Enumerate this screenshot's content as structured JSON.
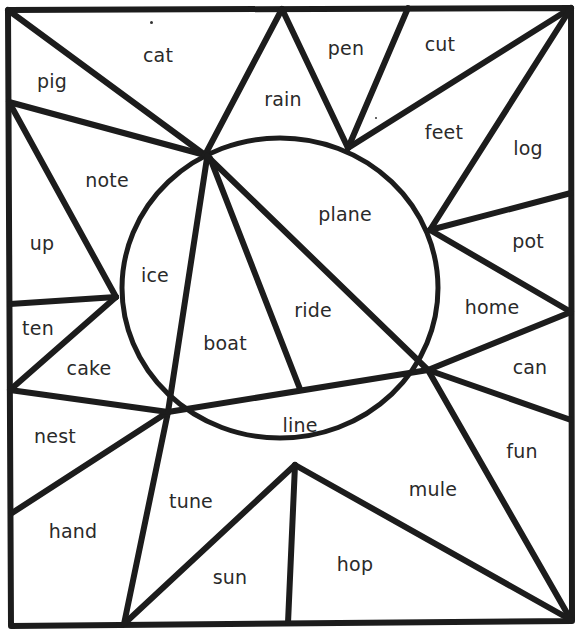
{
  "worksheet": {
    "type": "color-by-word puzzle",
    "stroke_color": "#1c1c1c",
    "text_color": "#2a2a2a",
    "background": "#ffffff",
    "regions": [
      {
        "id": "cat",
        "label": "cat",
        "x": 158,
        "y": 55
      },
      {
        "id": "pig",
        "label": "pig",
        "x": 52,
        "y": 81
      },
      {
        "id": "rain",
        "label": "rain",
        "x": 283,
        "y": 99
      },
      {
        "id": "pen",
        "label": "pen",
        "x": 346,
        "y": 48
      },
      {
        "id": "cut",
        "label": "cut",
        "x": 440,
        "y": 44
      },
      {
        "id": "feet",
        "label": "feet",
        "x": 444,
        "y": 132
      },
      {
        "id": "log",
        "label": "log",
        "x": 528,
        "y": 148
      },
      {
        "id": "note",
        "label": "note",
        "x": 107,
        "y": 180
      },
      {
        "id": "plane",
        "label": "plane",
        "x": 345,
        "y": 214
      },
      {
        "id": "up",
        "label": "up",
        "x": 42,
        "y": 243
      },
      {
        "id": "pot",
        "label": "pot",
        "x": 528,
        "y": 241
      },
      {
        "id": "ice",
        "label": "ice",
        "x": 155,
        "y": 275
      },
      {
        "id": "ride",
        "label": "ride",
        "x": 313,
        "y": 310
      },
      {
        "id": "home",
        "label": "home",
        "x": 492,
        "y": 307
      },
      {
        "id": "ten",
        "label": "ten",
        "x": 38,
        "y": 328
      },
      {
        "id": "boat",
        "label": "boat",
        "x": 225,
        "y": 343
      },
      {
        "id": "cake",
        "label": "cake",
        "x": 89,
        "y": 368
      },
      {
        "id": "can",
        "label": "can",
        "x": 530,
        "y": 367
      },
      {
        "id": "line",
        "label": "line",
        "x": 300,
        "y": 425
      },
      {
        "id": "nest",
        "label": "nest",
        "x": 55,
        "y": 436
      },
      {
        "id": "fun",
        "label": "fun",
        "x": 522,
        "y": 451
      },
      {
        "id": "mule",
        "label": "mule",
        "x": 433,
        "y": 489
      },
      {
        "id": "tune",
        "label": "tune",
        "x": 191,
        "y": 501
      },
      {
        "id": "hand",
        "label": "hand",
        "x": 73,
        "y": 531
      },
      {
        "id": "hop",
        "label": "hop",
        "x": 355,
        "y": 564
      },
      {
        "id": "sun",
        "label": "sun",
        "x": 230,
        "y": 577
      }
    ]
  }
}
